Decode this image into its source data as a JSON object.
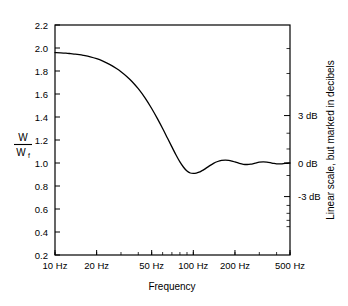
{
  "chart_data": {
    "type": "line",
    "title": "",
    "xlabel": "Frequency",
    "ylabel": "W/Wf",
    "ylabel_numerator": "W",
    "ylabel_denominator": "W",
    "ylabel_denominator_subscript": "f",
    "x_scale": "log",
    "y_scale": "linear",
    "xlim": [
      10,
      500
    ],
    "ylim": [
      0.2,
      2.2
    ],
    "grid": false,
    "legend": null,
    "x_tick_labels": [
      "10 Hz",
      "20 Hz",
      "50 Hz",
      "100 Hz",
      "200 Hz",
      "500 Hz"
    ],
    "x_tick_values": [
      10,
      20,
      50,
      100,
      200,
      500
    ],
    "y_tick_labels": [
      "0.2",
      "0.4",
      "0.6",
      "0.8",
      "1.0",
      "1.2",
      "1.4",
      "1.6",
      "1.8",
      "2.0",
      "2.2"
    ],
    "y_tick_values": [
      0.2,
      0.4,
      0.6,
      0.8,
      1.0,
      1.2,
      1.4,
      1.6,
      1.8,
      2.0,
      2.2
    ],
    "secondary_axis": {
      "label": "Linear scale, but marked in decibels",
      "tick_labels": [
        "3 dB",
        "0 dB",
        "-3 dB"
      ],
      "tick_values": [
        1.4125,
        1.0,
        0.7079
      ],
      "minor_tick_values": [
        1.9953,
        1.7783,
        1.5849,
        1.2589,
        1.122,
        0.8913,
        0.631,
        0.5623,
        0.5012,
        0.4467
      ]
    },
    "series": [
      {
        "name": "W/Wf",
        "x": [
          10,
          11,
          12,
          13,
          14,
          15,
          16,
          18,
          20,
          22,
          25,
          28,
          30,
          33,
          36,
          40,
          45,
          50,
          55,
          60,
          65,
          70,
          75,
          80,
          85,
          90,
          95,
          100,
          105,
          110,
          115,
          120,
          130,
          140,
          150,
          160,
          170,
          180,
          190,
          200,
          215,
          230,
          245,
          260,
          280,
          300,
          320,
          340,
          360,
          380,
          400,
          430,
          460,
          500
        ],
        "y": [
          1.96,
          1.958,
          1.955,
          1.951,
          1.947,
          1.942,
          1.936,
          1.923,
          1.907,
          1.888,
          1.856,
          1.82,
          1.794,
          1.753,
          1.709,
          1.646,
          1.562,
          1.474,
          1.386,
          1.3,
          1.217,
          1.14,
          1.07,
          1.01,
          0.963,
          0.93,
          0.913,
          0.909,
          0.912,
          0.92,
          0.932,
          0.945,
          0.973,
          0.997,
          1.013,
          1.022,
          1.025,
          1.023,
          1.017,
          1.009,
          0.997,
          0.989,
          0.987,
          0.99,
          0.999,
          1.007,
          1.01,
          1.008,
          1.003,
          0.997,
          0.993,
          0.992,
          0.996,
          1.0
        ]
      }
    ]
  },
  "axes": {
    "x_title": "Frequency",
    "right_title": "Linear scale, but marked in decibels"
  }
}
